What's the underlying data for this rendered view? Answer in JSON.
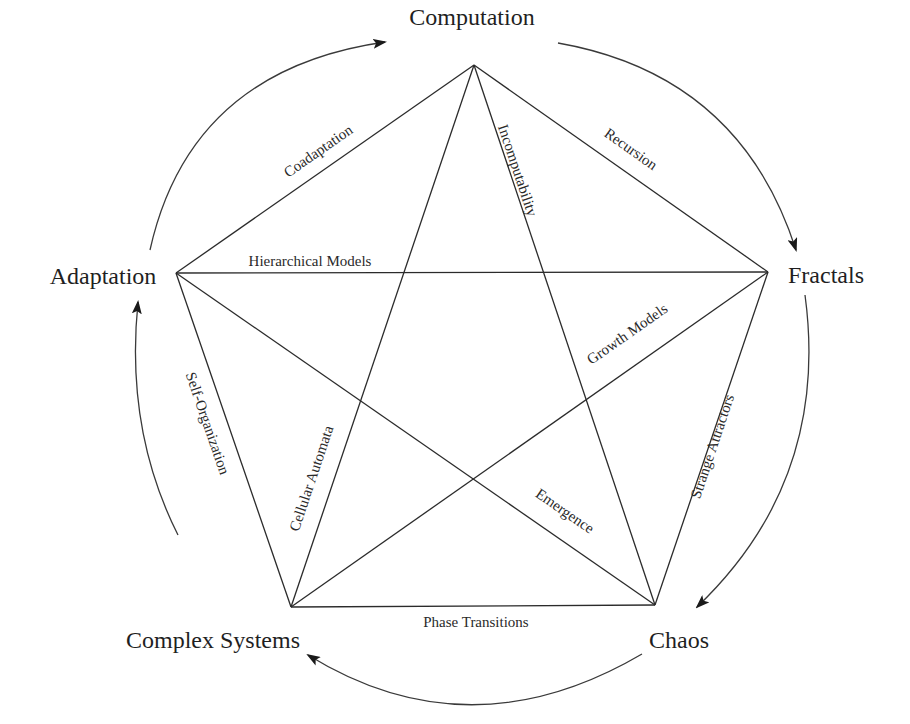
{
  "diagram": {
    "type": "pentagram-concept-map",
    "nodes": {
      "computation": "Computation",
      "fractals": "Fractals",
      "chaos": "Chaos",
      "complex_systems": "Complex Systems",
      "adaptation": "Adaptation"
    },
    "edges": {
      "computation_adaptation": "Coadaptation",
      "computation_fractals": "Recursion",
      "computation_chaos": "Incomputability",
      "computation_complex_systems": "Cellular Automata",
      "adaptation_fractals": "Hierarchical Models",
      "adaptation_complex_systems": "Self-Organization",
      "adaptation_chaos": "Emergence",
      "fractals_chaos": "Strange Attractors",
      "fractals_complex_systems": "Growth Models",
      "complex_systems_chaos": "Phase Transitions"
    },
    "cycle_order": [
      "Computation",
      "Fractals",
      "Chaos",
      "Complex Systems",
      "Adaptation"
    ],
    "colors": {
      "line": "#2b2b2b",
      "text": "#1f1f1f",
      "background": "#ffffff"
    }
  }
}
